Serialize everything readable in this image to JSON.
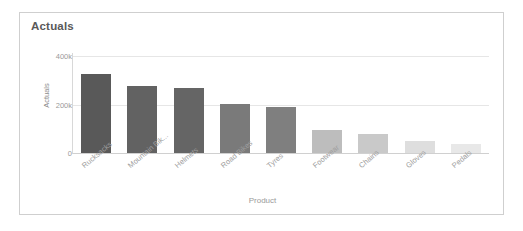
{
  "card": {
    "title": "Actuals",
    "border_color": "#cfcfcf",
    "background": "#ffffff"
  },
  "chart_data": {
    "type": "bar",
    "title": "Actuals",
    "xlabel": "Product",
    "ylabel": "Actuals",
    "categories": [
      "Rucksacks",
      "Mountain Bik...",
      "Helmets",
      "Road Bikes",
      "Tyres",
      "Footwear",
      "Chains",
      "Gloves",
      "Pedals"
    ],
    "values": [
      325000,
      275000,
      268000,
      202000,
      190000,
      95000,
      78000,
      50000,
      38000
    ],
    "bar_colors": [
      "#595959",
      "#626262",
      "#656565",
      "#7a7a7a",
      "#7f7f7f",
      "#bdbdbd",
      "#c9c9c9",
      "#dedede",
      "#e8e8e8"
    ],
    "ylim": [
      0,
      420000
    ],
    "ytick_values": [
      0,
      200000,
      400000
    ],
    "ytick_labels": [
      "0",
      "200k",
      "400k"
    ],
    "grid": true,
    "legend": "none"
  }
}
